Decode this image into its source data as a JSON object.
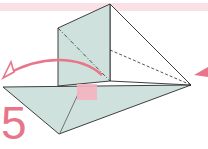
{
  "diagram": {
    "type": "origami-instruction",
    "step_number": "5",
    "colors": {
      "paper": "#cfe1dc",
      "line": "#2a2a2a",
      "accent": "#e8758a",
      "band": "#f9e1e6",
      "mark": "#f4b3bf"
    },
    "elements": [
      {
        "name": "standing-flap",
        "kind": "shaded-face"
      },
      {
        "name": "base-triangle",
        "kind": "shaded-face"
      },
      {
        "name": "valley-fold-line",
        "kind": "dashed-line"
      },
      {
        "name": "fold-over-arrow",
        "kind": "curved-arrow",
        "direction": "left"
      },
      {
        "name": "push-arrow",
        "kind": "arrowhead",
        "direction": "left"
      },
      {
        "name": "hold-point-mark",
        "kind": "pink-square"
      }
    ]
  }
}
